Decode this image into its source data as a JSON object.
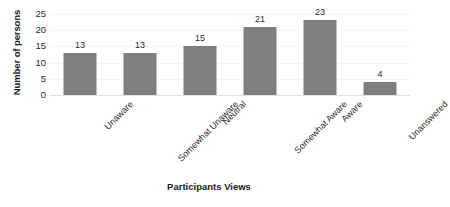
{
  "chart_data": {
    "type": "bar",
    "title": "",
    "categories": [
      "Unaware",
      "Somewhat Unaware",
      "Neutral",
      "Somewhat Aware",
      "Aware",
      "Unanswered"
    ],
    "values": [
      13,
      13,
      15,
      21,
      23,
      4
    ],
    "xlabel": "Participants Views",
    "ylabel": "Number of persons",
    "ylim": [
      0,
      25
    ],
    "yticks": [
      0,
      5,
      10,
      15,
      20,
      25
    ],
    "grid": true,
    "legend": "none",
    "bar_color": "#7f7f7f",
    "text_color": "#2b2b2b",
    "gridline_color": "#f4f4f4",
    "background_color": "#ffffff"
  }
}
